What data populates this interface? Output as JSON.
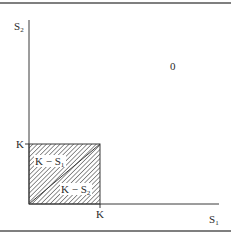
{
  "diagram": {
    "axes": {
      "x_label": "S",
      "x_label_sub": "1",
      "y_label": "S",
      "y_label_sub": "2"
    },
    "ticks": {
      "x_tick": "K",
      "y_tick": "K"
    },
    "regions": {
      "outer_value": "0",
      "upper_triangle_label": "K − S",
      "upper_triangle_sub": "1",
      "lower_triangle_label": "K − S",
      "lower_triangle_sub": "2"
    },
    "colors": {
      "line": "#3a3a3a",
      "border": "#555555",
      "hatch": "#3a3a3a",
      "background": "#ffffff"
    }
  }
}
